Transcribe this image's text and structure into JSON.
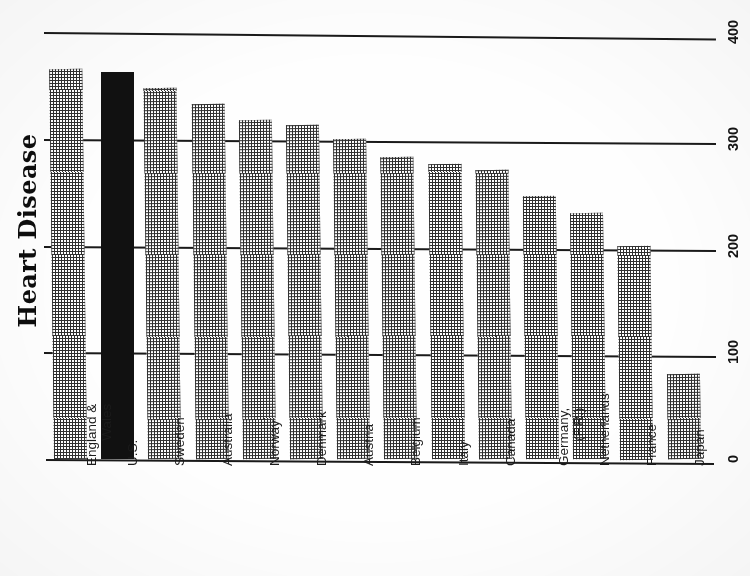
{
  "chart_data": {
    "type": "bar",
    "title": "Heart Disease",
    "xlabel": "",
    "ylabel": "",
    "ylim": [
      0,
      400
    ],
    "yticks": [
      "0",
      "100",
      "200",
      "300",
      "400"
    ],
    "grid": true,
    "legend": null,
    "orientation": "vertical-bars-page-rotated-90",
    "highlight": {
      "category": "U.S.",
      "style": "solid-black-fill",
      "color": "#111111"
    },
    "bar_style": {
      "default_fill": "cross-hatch",
      "hatch_color": "#2f2f2f",
      "background": "#ffffff"
    },
    "categories": [
      "England & Wales",
      "U.S.",
      "Sweden",
      "Australia",
      "Norway",
      "Denmark",
      "Austria",
      "Belgium",
      "Italy",
      "Canada",
      "Germany, (F.R.)",
      "Netherlands",
      "France",
      "Japan"
    ],
    "values": [
      365,
      363,
      348,
      333,
      318,
      313,
      300,
      283,
      276,
      271,
      246,
      230,
      200,
      80
    ]
  },
  "axis_labels": {
    "t0": "0",
    "t100": "100",
    "t200": "200",
    "t300": "300",
    "t400": "400"
  },
  "categories_display": [
    {
      "l1": "England &",
      "l2": "Wales"
    },
    {
      "l1": "U.S.",
      "l2": ""
    },
    {
      "l1": "Sweden",
      "l2": ""
    },
    {
      "l1": "Australia",
      "l2": ""
    },
    {
      "l1": "Norway",
      "l2": ""
    },
    {
      "l1": "Denmark",
      "l2": ""
    },
    {
      "l1": "Austria",
      "l2": ""
    },
    {
      "l1": "Belgium",
      "l2": ""
    },
    {
      "l1": "Italy",
      "l2": ""
    },
    {
      "l1": "Canada",
      "l2": ""
    },
    {
      "l1": "Germany,",
      "l2": "(F.R.)"
    },
    {
      "l1": "Netherlands",
      "l2": ""
    },
    {
      "l1": "France",
      "l2": ""
    },
    {
      "l1": "Japan",
      "l2": ""
    }
  ]
}
